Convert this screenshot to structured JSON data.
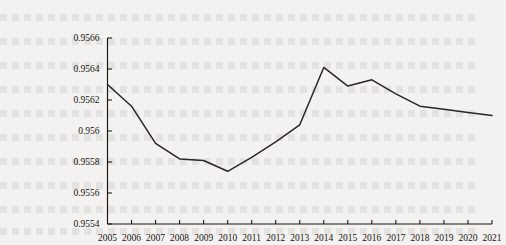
{
  "chart_data": {
    "type": "line",
    "title": "",
    "subtitle": "",
    "xlabel": "",
    "ylabel": "",
    "grid": false,
    "legend": false,
    "legend_position": "none",
    "xlim": [
      2005,
      2021
    ],
    "ylim": [
      0.9554,
      0.9566
    ],
    "ytick_step": 0.0002,
    "categories": [
      "2005",
      "2006",
      "2007",
      "2008",
      "2009",
      "2010",
      "2011",
      "2012",
      "2013",
      "2014",
      "2015",
      "2016",
      "2017",
      "2018",
      "2019",
      "2020",
      "2021"
    ],
    "ytick_labels": [
      "0.9566",
      "0.9564",
      "0.9562",
      "0.956",
      "0.9558",
      "0.9556",
      "0.9554"
    ],
    "ytick_values": [
      0.9566,
      0.9564,
      0.9562,
      0.956,
      0.9558,
      0.9556,
      0.9554
    ],
    "series": [
      {
        "name": "",
        "color": "#2a2622",
        "values": [
          0.9563,
          0.95616,
          0.95592,
          0.95582,
          0.95581,
          0.95574,
          0.95583,
          0.95593,
          0.95604,
          0.95641,
          0.95629,
          0.95633,
          0.95624,
          0.95616,
          0.95614,
          0.95612,
          0.9561
        ]
      }
    ],
    "annotations": []
  },
  "axes": {
    "x_axis_name": "year-axis",
    "y_axis_name": "value-axis"
  }
}
